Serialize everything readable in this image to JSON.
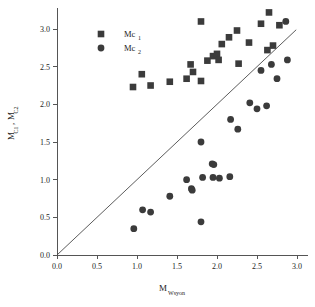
{
  "chart_data": {
    "type": "scatter",
    "title": "",
    "xlabel": "M",
    "xlabel_sub": "Wsyon",
    "ylabel": "M",
    "ylabel_sub_1": "C1",
    "ylabel_sub_2": "C2",
    "ylabel_full": "M_C1, M_C2",
    "xlim": [
      0.0,
      3.0
    ],
    "ylim": [
      0.0,
      3.25
    ],
    "xticks": [
      "0.0",
      "0.5",
      "1.0",
      "1.5",
      "2.0",
      "2.5",
      "3.0"
    ],
    "xtick_values": [
      0.0,
      0.5,
      1.0,
      1.5,
      2.0,
      2.5,
      3.0
    ],
    "yticks": [
      "0.0",
      "0.5",
      "1.0",
      "1.5",
      "2.0",
      "2.5",
      "3.0"
    ],
    "ytick_values": [
      0.0,
      0.5,
      1.0,
      1.5,
      2.0,
      2.5,
      3.0
    ],
    "grid": false,
    "legend_position": "top-left",
    "marker_color": "#3b3b3b",
    "reference_line": {
      "name": "one-to-one-line",
      "x": [
        0.0,
        2.99
      ],
      "y": [
        0.0,
        2.99
      ],
      "color": "#4a4a4a"
    },
    "series": [
      {
        "name": "Mc1",
        "label": "Mc",
        "label_sub": "1",
        "marker": "square",
        "color": "#3b3b3b",
        "points": [
          [
            0.95,
            2.23
          ],
          [
            1.06,
            2.4
          ],
          [
            1.17,
            2.25
          ],
          [
            1.41,
            2.3
          ],
          [
            1.62,
            2.34
          ],
          [
            1.7,
            2.43
          ],
          [
            1.67,
            2.53
          ],
          [
            1.8,
            3.1
          ],
          [
            1.8,
            2.31
          ],
          [
            1.88,
            2.58
          ],
          [
            1.95,
            2.64
          ],
          [
            2.0,
            2.67
          ],
          [
            2.02,
            2.59
          ],
          [
            2.06,
            2.8
          ],
          [
            2.15,
            2.89
          ],
          [
            2.25,
            2.98
          ],
          [
            2.27,
            2.54
          ],
          [
            2.4,
            2.82
          ],
          [
            2.55,
            3.07
          ],
          [
            2.63,
            2.72
          ],
          [
            2.65,
            3.22
          ],
          [
            2.7,
            2.78
          ],
          [
            2.78,
            3.05
          ]
        ]
      },
      {
        "name": "Mc2",
        "label": "Mc",
        "label_sub": "2",
        "marker": "circle",
        "color": "#3b3b3b",
        "points": [
          [
            0.96,
            0.35
          ],
          [
            1.07,
            0.6
          ],
          [
            1.17,
            0.57
          ],
          [
            1.41,
            0.78
          ],
          [
            1.62,
            1.0
          ],
          [
            1.68,
            0.88
          ],
          [
            1.69,
            0.86
          ],
          [
            1.8,
            1.5
          ],
          [
            1.8,
            0.44
          ],
          [
            1.82,
            1.03
          ],
          [
            1.94,
            1.21
          ],
          [
            1.96,
            1.2
          ],
          [
            1.95,
            1.03
          ],
          [
            2.03,
            1.02
          ],
          [
            2.16,
            1.04
          ],
          [
            2.17,
            1.8
          ],
          [
            2.26,
            1.67
          ],
          [
            2.41,
            2.02
          ],
          [
            2.5,
            1.94
          ],
          [
            2.55,
            2.45
          ],
          [
            2.62,
            1.98
          ],
          [
            2.68,
            2.53
          ],
          [
            2.75,
            2.34
          ],
          [
            2.86,
            3.1
          ],
          [
            2.88,
            2.59
          ]
        ]
      }
    ]
  }
}
